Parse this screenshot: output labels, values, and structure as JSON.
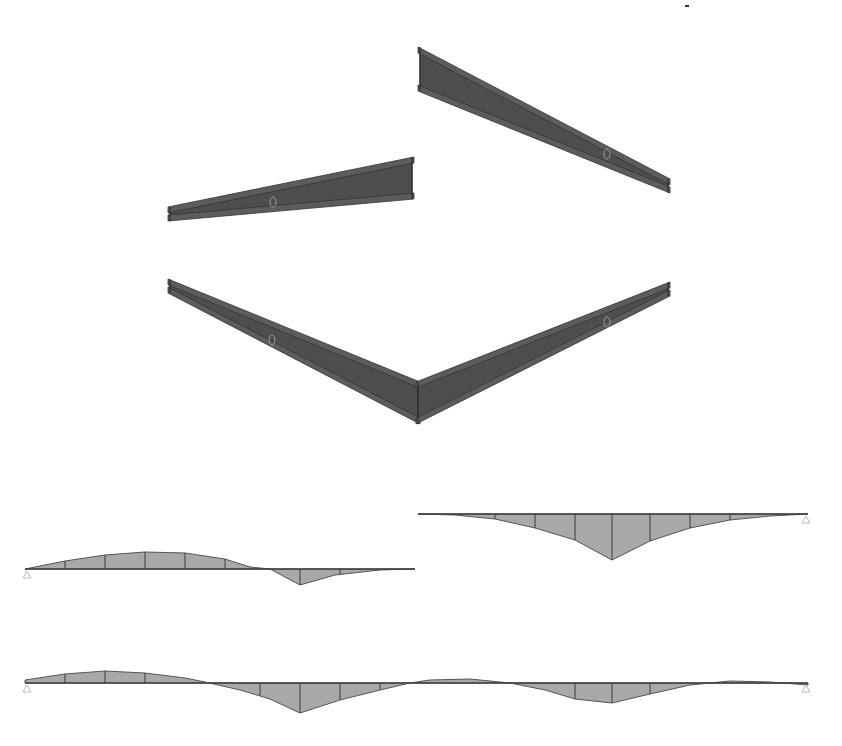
{
  "figure": {
    "background": "#ffffff",
    "beam_color": "#4e4e4e",
    "diagram_fill_color": "#a9a9a9"
  },
  "beams": [
    {
      "id": "beam-upper-right",
      "start": [
        420,
        50
      ],
      "end": [
        668,
        182
      ],
      "depth_start": 38,
      "depth_end": 8,
      "mid_node": [
        607,
        154
      ]
    },
    {
      "id": "beam-middle-left",
      "start": [
        170,
        210
      ],
      "end": [
        412,
        160
      ],
      "depth_start": 8,
      "depth_end": 36,
      "mid_node": [
        273,
        202
      ]
    },
    {
      "id": "beam-v-frame-left",
      "start": [
        170,
        282
      ],
      "end": [
        418,
        385
      ],
      "depth_start": 8,
      "depth_end": 36,
      "mid_node": [
        272,
        340
      ]
    },
    {
      "id": "beam-v-frame-right",
      "start": [
        418,
        385
      ],
      "end": [
        668,
        285
      ],
      "depth_start": 36,
      "depth_end": 8,
      "mid_node": [
        607,
        322
      ]
    }
  ],
  "moment_diagrams": [
    {
      "id": "diagram-left-span",
      "baseline_y": 569,
      "x_start": 25,
      "x_end": 415,
      "supports": [
        {
          "x": 27,
          "type": "pin"
        }
      ],
      "profile": [
        [
          25,
          569
        ],
        [
          65,
          561
        ],
        [
          105,
          555
        ],
        [
          145,
          552
        ],
        [
          185,
          553
        ],
        [
          225,
          559
        ],
        [
          250,
          567
        ],
        [
          270,
          569
        ],
        [
          300,
          585
        ],
        [
          335,
          575
        ],
        [
          380,
          570
        ],
        [
          415,
          569
        ]
      ],
      "ordinates_x": [
        65,
        105,
        145,
        185,
        225,
        300,
        340
      ]
    },
    {
      "id": "diagram-right-span",
      "baseline_y": 514,
      "x_start": 418,
      "x_end": 808,
      "supports": [
        {
          "x": 806,
          "type": "roller"
        }
      ],
      "profile": [
        [
          418,
          514
        ],
        [
          455,
          515
        ],
        [
          495,
          519
        ],
        [
          535,
          528
        ],
        [
          575,
          540
        ],
        [
          612,
          560
        ],
        [
          650,
          541
        ],
        [
          690,
          528
        ],
        [
          730,
          520
        ],
        [
          770,
          516
        ],
        [
          808,
          514
        ]
      ],
      "ordinates_x": [
        495,
        535,
        575,
        612,
        650,
        690,
        730
      ]
    },
    {
      "id": "diagram-continuous-beam",
      "baseline_y": 683,
      "x_start": 25,
      "x_end": 808,
      "supports": [
        {
          "x": 27,
          "type": "pin"
        },
        {
          "x": 806,
          "type": "roller"
        }
      ],
      "profile": [
        [
          25,
          680
        ],
        [
          65,
          674
        ],
        [
          105,
          671
        ],
        [
          145,
          673
        ],
        [
          185,
          678
        ],
        [
          205,
          682
        ],
        [
          240,
          690
        ],
        [
          270,
          699
        ],
        [
          300,
          713
        ],
        [
          340,
          700
        ],
        [
          380,
          690
        ],
        [
          410,
          683
        ],
        [
          430,
          680
        ],
        [
          470,
          679
        ],
        [
          510,
          683
        ],
        [
          545,
          690
        ],
        [
          575,
          699
        ],
        [
          612,
          703
        ],
        [
          650,
          694
        ],
        [
          690,
          685
        ],
        [
          730,
          681
        ],
        [
          770,
          682
        ],
        [
          808,
          685
        ]
      ],
      "ordinates_x": [
        65,
        105,
        145,
        260,
        300,
        340,
        380,
        575,
        612,
        650
      ]
    }
  ],
  "marks": [
    {
      "id": "stray-dot",
      "x": 687,
      "y": 6
    }
  ]
}
